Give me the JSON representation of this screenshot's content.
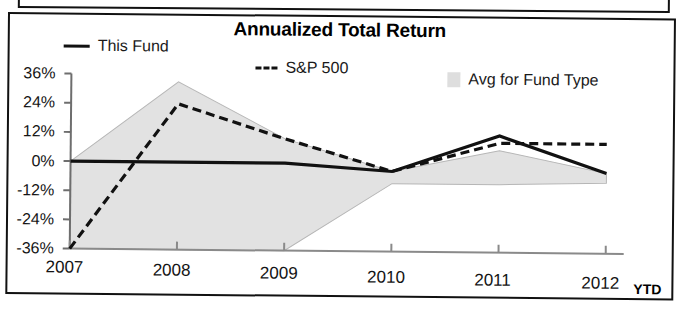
{
  "figure": {
    "title": "Annualized Total Return",
    "ytd_note": "YTD"
  },
  "legend": [
    {
      "label": "This Fund",
      "marker": "solid-line-swatch"
    },
    {
      "label": "S&P 500",
      "marker": "dashed-line-swatch"
    },
    {
      "label": "Avg for Fund Type",
      "marker": "shaded-area-swatch"
    }
  ],
  "axes": {
    "y_ticks": [
      "36%",
      "24%",
      "12%",
      "0%",
      "-12%",
      "-24%",
      "-36%"
    ],
    "x_ticks": [
      "2007",
      "2008",
      "2009",
      "2010",
      "2011",
      "2012"
    ]
  },
  "colors": {
    "line": "#111111",
    "band": "#e2e2e2",
    "band_edge": "#b5b5b5",
    "axis": "#6e6e6e",
    "frame": "#111111",
    "text": "#141414"
  },
  "chart_data": {
    "type": "line",
    "title": "Annualized Total Return",
    "xlabel": "",
    "ylabel": "",
    "x": [
      "2007",
      "2008",
      "2009",
      "2010",
      "2011",
      "2012"
    ],
    "x_note": "2012 value is YTD",
    "ylim": [
      -36,
      36
    ],
    "ytick_values": [
      36,
      24,
      12,
      0,
      -12,
      -24,
      -36
    ],
    "grid": false,
    "legend_position": "top",
    "series": [
      {
        "name": "This Fund",
        "style": "solid",
        "values": [
          0,
          0,
          0,
          -3,
          12,
          -3
        ]
      },
      {
        "name": "S&P 500",
        "style": "dashed",
        "values": [
          -36,
          24,
          10,
          -3,
          9,
          9
        ]
      },
      {
        "name": "Avg for Fund Type",
        "style": "shaded-band",
        "band_upper": [
          0,
          33,
          10,
          -3,
          6,
          -3
        ],
        "band_lower": [
          -36,
          -36,
          -36,
          -8,
          -8,
          -7
        ]
      }
    ]
  }
}
